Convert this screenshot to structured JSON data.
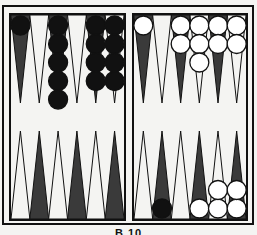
{
  "board": {
    "title": "Backgammon position",
    "colors": {
      "background": "#f4f4f2",
      "dark_point": "#3a3a3a",
      "light_point": "#f4f4f2",
      "frame": "#111111",
      "black_checker": "#111111",
      "white_checker": "#ffffff"
    },
    "quadrants": {
      "top_left": {
        "point_colors": [
          "dark",
          "light",
          "dark",
          "light",
          "dark",
          "light"
        ],
        "checkers": [
          {
            "color": "black",
            "count": 1
          },
          {
            "color": null,
            "count": 0
          },
          {
            "color": "black",
            "count": 5
          },
          {
            "color": null,
            "count": 0
          },
          {
            "color": "black",
            "count": 4
          },
          {
            "color": "black",
            "count": 4
          }
        ]
      },
      "top_right": {
        "point_colors": [
          "dark",
          "light",
          "dark",
          "light",
          "dark",
          "light"
        ],
        "checkers": [
          {
            "color": "white",
            "count": 1
          },
          {
            "color": null,
            "count": 0
          },
          {
            "color": "white",
            "count": 2
          },
          {
            "color": "white",
            "count": 3
          },
          {
            "color": "white",
            "count": 2
          },
          {
            "color": "white",
            "count": 2
          }
        ]
      },
      "bottom_left": {
        "point_colors": [
          "light",
          "dark",
          "light",
          "dark",
          "light",
          "dark"
        ],
        "checkers": [
          {
            "color": null,
            "count": 0
          },
          {
            "color": null,
            "count": 0
          },
          {
            "color": null,
            "count": 0
          },
          {
            "color": null,
            "count": 0
          },
          {
            "color": null,
            "count": 0
          },
          {
            "color": null,
            "count": 0
          }
        ]
      },
      "bottom_right": {
        "point_colors": [
          "light",
          "dark",
          "light",
          "dark",
          "light",
          "dark"
        ],
        "checkers": [
          {
            "color": null,
            "count": 0
          },
          {
            "color": "black",
            "count": 1
          },
          {
            "color": null,
            "count": 0
          },
          {
            "color": "white",
            "count": 1
          },
          {
            "color": "white",
            "count": 2
          },
          {
            "color": "white",
            "count": 2
          }
        ]
      }
    }
  },
  "caption": "B.10"
}
